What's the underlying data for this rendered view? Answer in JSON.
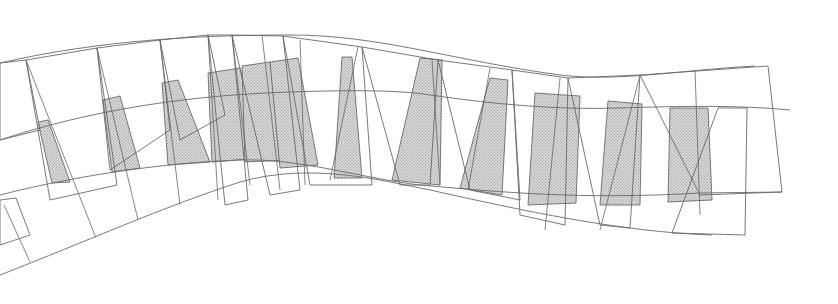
{
  "diagram": {
    "type": "architectural-line-drawing",
    "colors": {
      "line": "#6a6a6a",
      "panel_fill": "#c8c8c8",
      "background": "#ffffff"
    },
    "outer_curves": [
      "M0,63 C100,40 200,35 290,35 C380,35 450,60 560,75 C620,82 680,70 755,66",
      "M0,140 C90,110 190,95 290,92 C350,90 400,90 430,95 C500,105 560,110 620,108 C680,106 740,105 790,110",
      "M0,195 C90,172 180,162 240,160 C300,158 360,178 420,185 C500,192 580,200 700,193 L782,192",
      "M0,275 C90,240 160,208 240,182 C310,162 380,180 430,190 C520,210 620,232 712,235"
    ],
    "frames": [
      [
        [
          0,
          63
        ],
        [
          26,
          60
        ],
        [
          40,
          130
        ],
        [
          0,
          140
        ]
      ],
      [
        [
          26,
          60
        ],
        [
          97,
          48
        ],
        [
          117,
          185
        ],
        [
          50,
          200
        ]
      ],
      [
        [
          97,
          48
        ],
        [
          160,
          40
        ],
        [
          170,
          130
        ],
        [
          110,
          170
        ]
      ],
      [
        [
          160,
          40
        ],
        [
          208,
          35
        ],
        [
          225,
          115
        ],
        [
          180,
          140
        ]
      ],
      [
        [
          208,
          35
        ],
        [
          232,
          35
        ],
        [
          248,
          200
        ],
        [
          225,
          205
        ]
      ],
      [
        [
          232,
          35
        ],
        [
          283,
          36
        ],
        [
          300,
          190
        ],
        [
          270,
          195
        ]
      ],
      [
        [
          283,
          36
        ],
        [
          362,
          47
        ],
        [
          372,
          185
        ],
        [
          310,
          185
        ]
      ],
      [
        [
          362,
          47
        ],
        [
          438,
          60
        ],
        [
          430,
          185
        ],
        [
          400,
          185
        ]
      ],
      [
        [
          438,
          60
        ],
        [
          512,
          70
        ],
        [
          520,
          200
        ],
        [
          470,
          190
        ]
      ],
      [
        [
          512,
          70
        ],
        [
          568,
          78
        ],
        [
          565,
          225
        ],
        [
          520,
          215
        ]
      ],
      [
        [
          568,
          78
        ],
        [
          640,
          75
        ],
        [
          630,
          228
        ],
        [
          600,
          225
        ]
      ],
      [
        [
          640,
          75
        ],
        [
          768,
          66
        ],
        [
          782,
          192
        ],
        [
          700,
          195
        ]
      ],
      [
        [
          718,
          108
        ],
        [
          747,
          108
        ],
        [
          745,
          235
        ],
        [
          672,
          233
        ]
      ],
      [
        [
          0,
          200
        ],
        [
          16,
          198
        ],
        [
          30,
          235
        ],
        [
          0,
          245
        ]
      ]
    ],
    "panels": [
      [
        [
          38,
          122
        ],
        [
          48,
          120
        ],
        [
          70,
          182
        ],
        [
          52,
          183
        ]
      ],
      [
        [
          103,
          100
        ],
        [
          120,
          96
        ],
        [
          140,
          168
        ],
        [
          112,
          172
        ]
      ],
      [
        [
          162,
          83
        ],
        [
          178,
          80
        ],
        [
          210,
          162
        ],
        [
          168,
          165
        ]
      ],
      [
        [
          208,
          73
        ],
        [
          240,
          68
        ],
        [
          262,
          158
        ],
        [
          212,
          162
        ]
      ],
      [
        [
          242,
          66
        ],
        [
          270,
          62
        ],
        [
          290,
          160
        ],
        [
          245,
          162
        ]
      ],
      [
        [
          270,
          62
        ],
        [
          298,
          58
        ],
        [
          318,
          165
        ],
        [
          280,
          168
        ]
      ],
      [
        [
          342,
          57
        ],
        [
          352,
          57
        ],
        [
          362,
          178
        ],
        [
          334,
          178
        ]
      ],
      [
        [
          420,
          58
        ],
        [
          442,
          60
        ],
        [
          440,
          185
        ],
        [
          392,
          180
        ]
      ],
      [
        [
          490,
          78
        ],
        [
          508,
          80
        ],
        [
          502,
          195
        ],
        [
          460,
          188
        ]
      ],
      [
        [
          535,
          93
        ],
        [
          580,
          96
        ],
        [
          576,
          203
        ],
        [
          528,
          205
        ]
      ],
      [
        [
          608,
          101
        ],
        [
          642,
          104
        ],
        [
          640,
          205
        ],
        [
          600,
          205
        ]
      ],
      [
        [
          670,
          108
        ],
        [
          708,
          108
        ],
        [
          712,
          200
        ],
        [
          668,
          202
        ]
      ]
    ],
    "ribs": [
      "M26,60 L96,238",
      "M97,48 L138,220",
      "M160,40 L180,205",
      "M208,35 L218,200",
      "M232,35 L250,185",
      "M262,35 L280,190",
      "M300,40 L305,185",
      "M358,47 L330,180",
      "M432,60 L440,185",
      "M490,68 L468,190",
      "M560,78 L545,230",
      "M640,75 L600,230",
      "M695,70 L700,215",
      "M4,205 L30,262"
    ]
  }
}
